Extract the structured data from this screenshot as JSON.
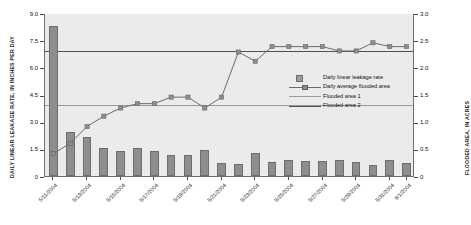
{
  "chart_data": {
    "type": "bar",
    "title": "",
    "xlabel": "",
    "ylabel": "DAILY LINEAR LEAKAGE RATE, IN INCHES PER DAY",
    "y2label": "FLOODED AREA, IN ACRES",
    "ylim": [
      0,
      9.0
    ],
    "y2lim": [
      0,
      3.0
    ],
    "grid": false,
    "legend_position": "upper-center-right",
    "y_ticks": [
      "0",
      "1.5",
      "3.0",
      "4.5",
      "6.0",
      "7.5",
      "9.0"
    ],
    "y_tick_values": [
      0,
      1.5,
      3.0,
      4.5,
      6.0,
      7.5,
      9.0
    ],
    "y2_ticks": [
      "0",
      "0.5",
      "1.0",
      "1.5",
      "2.0",
      "2.5",
      "3.0"
    ],
    "y2_tick_values": [
      0,
      0.5,
      1.0,
      1.5,
      2.0,
      2.5,
      3.0
    ],
    "x": [
      "5/11/2004",
      "5/12/2004",
      "5/13/2004",
      "5/14/2004",
      "5/15/2004",
      "5/16/2004",
      "5/17/2004",
      "5/18/2004",
      "5/19/2004",
      "5/20/2004",
      "5/21/2004",
      "5/22/2004",
      "5/23/2004",
      "5/24/2004",
      "5/25/2004",
      "5/26/2004",
      "5/27/2004",
      "5/28/2004",
      "5/29/2004",
      "5/30/2004",
      "5/31/2004",
      "6/1/2004"
    ],
    "x_tick_labels": [
      "5/11/2004",
      "5/13/2004",
      "5/15/2004",
      "5/17/2004",
      "5/19/2004",
      "5/21/2004",
      "5/23/2004",
      "5/25/2004",
      "5/27/2004",
      "5/29/2004",
      "5/31/2004",
      "6/1/2004"
    ],
    "x_tick_indices": [
      0,
      2,
      4,
      6,
      8,
      10,
      12,
      14,
      16,
      18,
      20,
      21
    ],
    "series": [
      {
        "name": "Daily linear leakage rate",
        "type": "bar",
        "axis": "left",
        "units": "inches per day",
        "color": "#8e8e8e",
        "values": [
          8.3,
          2.45,
          2.15,
          1.55,
          1.4,
          1.55,
          1.38,
          1.18,
          1.18,
          1.45,
          0.7,
          0.68,
          1.25,
          0.75,
          0.9,
          0.85,
          0.85,
          0.88,
          0.75,
          0.62,
          0.88,
          0.73
        ]
      },
      {
        "name": "Daily average flooded area",
        "type": "line",
        "axis": "right",
        "units": "acres",
        "color": "#6b6b6b",
        "marker": "square",
        "values": [
          0.43,
          0.62,
          0.93,
          1.12,
          1.27,
          1.35,
          1.35,
          1.47,
          1.47,
          1.27,
          1.47,
          2.3,
          2.13,
          2.4,
          2.4,
          2.4,
          2.4,
          2.32,
          2.32,
          2.47,
          2.4,
          2.4
        ]
      }
    ],
    "reference_lines": [
      {
        "name": "Flooded area 1",
        "axis": "right",
        "value": 1.33,
        "color": "#9a9a9a"
      },
      {
        "name": "Flooded area 2",
        "axis": "right",
        "value": 2.32,
        "color": "#4f4f4f"
      }
    ],
    "legend": [
      {
        "label": "Daily linear leakage rate",
        "key": "swatch"
      },
      {
        "label": "Daily average flooded area",
        "key": "line-marker"
      },
      {
        "label": "Flooded area 1",
        "key": "line-ref1"
      },
      {
        "label": "Flooded area 2",
        "key": "line-ref2"
      }
    ],
    "colors": {
      "plot_background": "#ebebeb",
      "bar_fill": "#8e8e8e",
      "bar_edge": "#6d6d6d",
      "line": "#6b6b6b",
      "marker": "#8e8e8e",
      "ref1": "#9a9a9a",
      "ref2": "#4f4f4f",
      "axis": "#6e6e6e",
      "text": "#111111"
    }
  }
}
